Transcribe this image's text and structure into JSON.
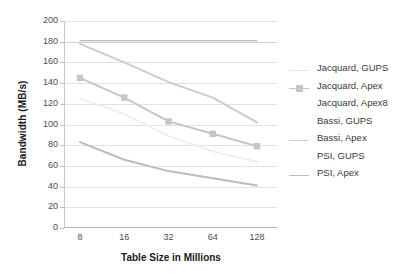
{
  "chart_data": {
    "type": "line",
    "title": "",
    "xlabel": "Table Size in Millions",
    "ylabel": "Bandwidth (MB/s)",
    "categories": [
      "8",
      "16",
      "32",
      "64",
      "128"
    ],
    "ylim": [
      0,
      200
    ],
    "ytick_labels": [
      "0",
      "20",
      "40",
      "60",
      "80",
      "100",
      "120",
      "140",
      "160",
      "180",
      "200"
    ],
    "ytick_values": [
      0,
      20,
      40,
      60,
      80,
      100,
      120,
      140,
      160,
      180,
      200
    ],
    "grid": "horizontal",
    "legend_position": "right",
    "series": [
      {
        "name": "Jacquard, GUPS",
        "values": [
          181,
          181,
          181,
          181,
          181
        ],
        "color": "#9aa7bd",
        "marker": "none",
        "legend_marker": "line-faint"
      },
      {
        "name": "Jacquard, Apex",
        "values": [
          145,
          126,
          103,
          91,
          79
        ],
        "color": "#c3c7cb",
        "marker": "square",
        "legend_marker": "line-square"
      },
      {
        "name": "Jacquard, Apex8",
        "values": [
          125,
          110,
          89,
          74,
          64
        ],
        "color": "#eceef0",
        "marker": "none",
        "legend_marker": "none"
      },
      {
        "name": "Bassi, GUPS",
        "values": [
          null,
          null,
          null,
          null,
          null
        ],
        "color": "#f2f4f5",
        "marker": "none",
        "legend_marker": "none"
      },
      {
        "name": "Bassi, Apex",
        "values": [
          178,
          160,
          141,
          126,
          102
        ],
        "color": "#c9ccd0",
        "marker": "none",
        "legend_marker": "line"
      },
      {
        "name": "PSI, GUPS",
        "values": [
          null,
          null,
          null,
          null,
          null
        ],
        "color": "#f2f4f5",
        "marker": "none",
        "legend_marker": "none"
      },
      {
        "name": "PSI, Apex",
        "values": [
          83,
          66,
          55,
          48,
          41
        ],
        "color": "#b9bcc0",
        "marker": "none",
        "legend_marker": "line"
      }
    ]
  },
  "legend": {
    "items": [
      {
        "label": "Jacquard, GUPS"
      },
      {
        "label": "Jacquard, Apex"
      },
      {
        "label": "Jacquard, Apex8"
      },
      {
        "label": "Bassi, GUPS"
      },
      {
        "label": "Bassi, Apex"
      },
      {
        "label": "PSI, GUPS"
      },
      {
        "label": "PSI, Apex"
      }
    ]
  },
  "colors": {
    "grid": "#e2e2e2",
    "axis": "#b4b4b4",
    "tick_text": "#4d4d4d",
    "title_text": "#1a1a1a",
    "legend_text": "#3a3a3a"
  }
}
